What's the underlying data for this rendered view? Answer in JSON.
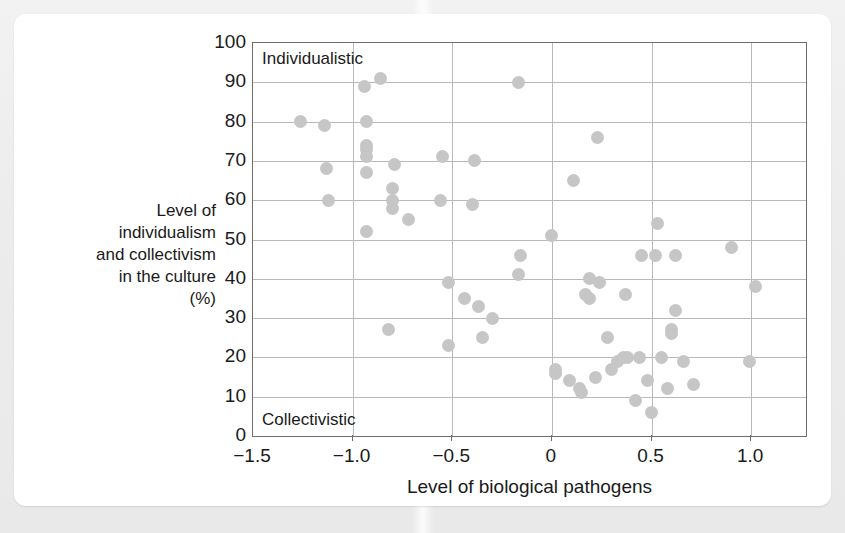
{
  "figure": {
    "y_axis_label": "Level of individualism and collectivism in the culture (%)",
    "x_axis_label": "Level of biological pathogens",
    "annotation_top": "Individualistic",
    "annotation_bottom": "Collectivistic",
    "dot_color": "#c6c6c6",
    "grid_color": "#b9b9b9",
    "frame_color": "#6d6d6d"
  },
  "chart_data": {
    "type": "scatter",
    "title": "",
    "xlabel": "Level of biological pathogens",
    "ylabel": "Level of individualism and collectivism in the culture (%)",
    "xlim": [
      -1.5,
      1.275
    ],
    "ylim": [
      0,
      100
    ],
    "xticks": [
      -1.5,
      -1.0,
      -0.5,
      0,
      0.5,
      1.0
    ],
    "xticklabels": [
      "−1.5",
      "−1.0",
      "−0.5",
      "0",
      "0.5",
      "1.0"
    ],
    "yticks": [
      0,
      10,
      20,
      30,
      40,
      50,
      60,
      70,
      80,
      90,
      100
    ],
    "yticklabels": [
      "0",
      "10",
      "20",
      "30",
      "40",
      "50",
      "60",
      "70",
      "80",
      "90",
      "100"
    ],
    "grid": true,
    "legend": false,
    "annotations": [
      {
        "text": "Individualistic",
        "x": -1.45,
        "y": 96
      },
      {
        "text": "Collectivistic",
        "x": -1.45,
        "y": 6
      }
    ],
    "points": [
      {
        "x": -1.26,
        "y": 80
      },
      {
        "x": -1.14,
        "y": 79
      },
      {
        "x": -1.13,
        "y": 68
      },
      {
        "x": -1.12,
        "y": 60
      },
      {
        "x": -0.94,
        "y": 89
      },
      {
        "x": -0.86,
        "y": 91
      },
      {
        "x": -0.93,
        "y": 80
      },
      {
        "x": -0.93,
        "y": 74
      },
      {
        "x": -0.93,
        "y": 73
      },
      {
        "x": -0.93,
        "y": 71
      },
      {
        "x": -0.93,
        "y": 67
      },
      {
        "x": -0.79,
        "y": 69
      },
      {
        "x": -0.8,
        "y": 63
      },
      {
        "x": -0.8,
        "y": 60
      },
      {
        "x": -0.8,
        "y": 58
      },
      {
        "x": -0.72,
        "y": 55
      },
      {
        "x": -0.93,
        "y": 52
      },
      {
        "x": -0.82,
        "y": 27
      },
      {
        "x": -0.55,
        "y": 71
      },
      {
        "x": -0.39,
        "y": 70
      },
      {
        "x": -0.56,
        "y": 60
      },
      {
        "x": -0.4,
        "y": 59
      },
      {
        "x": -0.52,
        "y": 39
      },
      {
        "x": -0.44,
        "y": 35
      },
      {
        "x": -0.37,
        "y": 33
      },
      {
        "x": -0.3,
        "y": 30
      },
      {
        "x": -0.35,
        "y": 25
      },
      {
        "x": -0.52,
        "y": 23
      },
      {
        "x": -0.17,
        "y": 90
      },
      {
        "x": -0.16,
        "y": 46
      },
      {
        "x": -0.17,
        "y": 41
      },
      {
        "x": 0.0,
        "y": 51
      },
      {
        "x": 0.23,
        "y": 76
      },
      {
        "x": 0.11,
        "y": 65
      },
      {
        "x": 0.53,
        "y": 54
      },
      {
        "x": 0.45,
        "y": 46
      },
      {
        "x": 0.62,
        "y": 46
      },
      {
        "x": 0.52,
        "y": 46
      },
      {
        "x": 0.9,
        "y": 48
      },
      {
        "x": 1.02,
        "y": 38
      },
      {
        "x": 0.19,
        "y": 40
      },
      {
        "x": 0.24,
        "y": 39
      },
      {
        "x": 0.17,
        "y": 36
      },
      {
        "x": 0.19,
        "y": 35
      },
      {
        "x": 0.37,
        "y": 36
      },
      {
        "x": 0.62,
        "y": 32
      },
      {
        "x": 0.6,
        "y": 27
      },
      {
        "x": 0.6,
        "y": 26
      },
      {
        "x": 0.28,
        "y": 25
      },
      {
        "x": 0.02,
        "y": 17
      },
      {
        "x": 0.02,
        "y": 16
      },
      {
        "x": 0.09,
        "y": 14
      },
      {
        "x": 0.14,
        "y": 12
      },
      {
        "x": 0.15,
        "y": 11
      },
      {
        "x": 0.22,
        "y": 15
      },
      {
        "x": 0.36,
        "y": 20
      },
      {
        "x": 0.38,
        "y": 20
      },
      {
        "x": 0.33,
        "y": 19
      },
      {
        "x": 0.3,
        "y": 17
      },
      {
        "x": 0.44,
        "y": 20
      },
      {
        "x": 0.55,
        "y": 20
      },
      {
        "x": 0.66,
        "y": 19
      },
      {
        "x": 0.48,
        "y": 14
      },
      {
        "x": 0.58,
        "y": 12
      },
      {
        "x": 0.71,
        "y": 13
      },
      {
        "x": 0.99,
        "y": 19
      },
      {
        "x": 0.42,
        "y": 9
      },
      {
        "x": 0.5,
        "y": 6
      }
    ]
  }
}
